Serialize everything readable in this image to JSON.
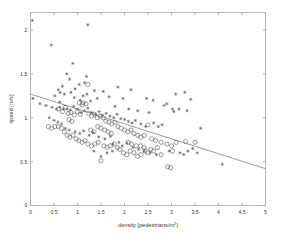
{
  "chart_data": {
    "type": "scatter",
    "title": "",
    "xlabel": "density [pedestrians/m²]",
    "xlabel_base": "density [pedestrians/m",
    "xlabel_sup": "2",
    "xlabel_tail": "]",
    "ylabel": "speed [m/s]",
    "xlim": [
      0,
      5
    ],
    "ylim": [
      0,
      2.2
    ],
    "grid": false,
    "legend": null,
    "xticks": [
      0,
      0.5,
      1,
      1.5,
      2,
      2.5,
      3,
      3.5,
      4,
      4.5,
      5
    ],
    "xtick_labels": [
      "0",
      "0.5",
      "1",
      "1.5",
      "2",
      "2.5",
      "3",
      "3.5",
      "4",
      "4.5",
      "5"
    ],
    "yticks": [
      0,
      0.5,
      1,
      1.5,
      2
    ],
    "ytick_labels": [
      "0",
      "0.5",
      "1",
      "1.5",
      "2"
    ],
    "marker_colors": {
      "circle": "#5c5c5c",
      "star": "#5c5c5c",
      "fit_line": "#6e6e6e",
      "axis": "#9a9a9a"
    },
    "fit_line": {
      "label": "linear fit",
      "x": [
        0,
        5
      ],
      "y": [
        1.27,
        0.42
      ],
      "slope": -0.17,
      "intercept": 1.27
    },
    "series": [
      {
        "name": "star-markers",
        "marker": "star",
        "points": [
          [
            0.04,
            2.11
          ],
          [
            0.44,
            1.83
          ],
          [
            1.22,
            2.06
          ],
          [
            0.9,
            1.62
          ],
          [
            0.77,
            1.5
          ],
          [
            0.83,
            1.44
          ],
          [
            1.19,
            1.47
          ],
          [
            1.04,
            1.38
          ],
          [
            0.68,
            1.36
          ],
          [
            0.59,
            1.32
          ],
          [
            0.63,
            1.29
          ],
          [
            1.36,
            1.31
          ],
          [
            1.2,
            1.27
          ],
          [
            0.05,
            1.22
          ],
          [
            0.52,
            1.25
          ],
          [
            0.72,
            1.27
          ],
          [
            0.86,
            1.29
          ],
          [
            0.93,
            1.23
          ],
          [
            1.06,
            1.2
          ],
          [
            1.12,
            1.25
          ],
          [
            1.28,
            1.19
          ],
          [
            1.42,
            1.22
          ],
          [
            1.55,
            1.3
          ],
          [
            1.67,
            1.24
          ],
          [
            1.86,
            1.35
          ],
          [
            2.14,
            1.32
          ],
          [
            2.47,
            1.22
          ],
          [
            2.61,
            1.2
          ],
          [
            3.09,
            1.27
          ],
          [
            3.28,
            1.29
          ],
          [
            3.41,
            1.21
          ],
          [
            3.16,
            1.1
          ],
          [
            2.84,
            1.14
          ],
          [
            2.9,
            1.16
          ],
          [
            3.02,
            1.1
          ],
          [
            3.33,
            1.08
          ],
          [
            0.2,
            1.16
          ],
          [
            0.33,
            1.14
          ],
          [
            0.46,
            1.12
          ],
          [
            0.55,
            1.1
          ],
          [
            0.62,
            1.12
          ],
          [
            0.7,
            1.1
          ],
          [
            0.78,
            1.1
          ],
          [
            0.85,
            1.09
          ],
          [
            0.92,
            1.13
          ],
          [
            1.0,
            1.1
          ],
          [
            1.08,
            1.06
          ],
          [
            1.15,
            1.08
          ],
          [
            1.22,
            1.11
          ],
          [
            1.3,
            1.06
          ],
          [
            1.38,
            1.04
          ],
          [
            1.46,
            1.07
          ],
          [
            1.53,
            1.03
          ],
          [
            1.61,
            1.05
          ],
          [
            1.69,
            1.02
          ],
          [
            1.77,
            1.0
          ],
          [
            1.84,
            1.04
          ],
          [
            1.92,
            0.99
          ],
          [
            2.0,
            0.98
          ],
          [
            2.08,
            0.96
          ],
          [
            2.16,
            0.94
          ],
          [
            2.23,
            0.97
          ],
          [
            2.35,
            0.93
          ],
          [
            2.45,
            0.9
          ],
          [
            0.4,
            1.0
          ],
          [
            0.5,
            0.97
          ],
          [
            0.58,
            0.95
          ],
          [
            0.66,
            0.93
          ],
          [
            0.74,
            0.88
          ],
          [
            0.82,
            0.86
          ],
          [
            0.95,
            0.84
          ],
          [
            1.05,
            0.82
          ],
          [
            1.13,
            0.85
          ],
          [
            1.25,
            0.8
          ],
          [
            1.33,
            0.83
          ],
          [
            1.45,
            0.78
          ],
          [
            1.58,
            0.76
          ],
          [
            1.7,
            0.79
          ],
          [
            1.75,
            0.7
          ],
          [
            1.88,
            0.72
          ],
          [
            1.95,
            0.68
          ],
          [
            2.05,
            0.71
          ],
          [
            2.18,
            0.66
          ],
          [
            2.3,
            0.64
          ],
          [
            2.42,
            0.62
          ],
          [
            2.55,
            0.6
          ],
          [
            2.68,
            0.58
          ],
          [
            2.95,
            0.62
          ],
          [
            3.18,
            0.6
          ],
          [
            3.26,
            0.58
          ],
          [
            3.35,
            0.62
          ],
          [
            3.45,
            0.65
          ],
          [
            3.62,
            0.88
          ],
          [
            3.55,
            0.6
          ],
          [
            4.08,
            0.47
          ],
          [
            2.8,
            0.92
          ],
          [
            2.62,
            0.94
          ],
          [
            2.72,
            0.9
          ],
          [
            1.5,
            0.56
          ],
          [
            1.63,
            0.6
          ],
          [
            1.74,
            0.62
          ],
          [
            3.05,
            1.07
          ],
          [
            2.52,
            1.06
          ],
          [
            2.28,
            1.08
          ],
          [
            1.97,
            1.22
          ],
          [
            2.09,
            1.1
          ],
          [
            1.8,
            1.13
          ],
          [
            1.35,
            0.62
          ],
          [
            0.95,
            1.33
          ],
          [
            1.15,
            1.4
          ],
          [
            0.62,
            1.18
          ]
        ]
      },
      {
        "name": "circle-markers",
        "marker": "circle",
        "points": [
          [
            0.38,
            0.9
          ],
          [
            0.45,
            0.88
          ],
          [
            0.52,
            0.9
          ],
          [
            0.6,
            1.1
          ],
          [
            0.68,
            1.07
          ],
          [
            0.74,
            1.12
          ],
          [
            0.8,
            1.05
          ],
          [
            0.86,
            1.06
          ],
          [
            0.93,
            1.03
          ],
          [
            1.0,
            1.07
          ],
          [
            1.06,
            1.04
          ],
          [
            1.1,
            1.15
          ],
          [
            1.18,
            1.16
          ],
          [
            1.24,
            1.05
          ],
          [
            1.3,
            1.02
          ],
          [
            1.36,
            1.04
          ],
          [
            1.42,
            1.0
          ],
          [
            1.48,
            1.02
          ],
          [
            1.55,
            1.0
          ],
          [
            1.6,
            0.96
          ],
          [
            1.67,
            0.95
          ],
          [
            1.73,
            0.93
          ],
          [
            1.8,
            0.95
          ],
          [
            1.86,
            0.9
          ],
          [
            1.93,
            0.88
          ],
          [
            2.0,
            0.86
          ],
          [
            2.07,
            0.84
          ],
          [
            2.14,
            0.86
          ],
          [
            2.2,
            0.82
          ],
          [
            2.28,
            0.8
          ],
          [
            2.35,
            0.78
          ],
          [
            2.42,
            0.8
          ],
          [
            2.5,
            0.92
          ],
          [
            2.58,
            0.76
          ],
          [
            2.66,
            0.74
          ],
          [
            2.78,
            0.72
          ],
          [
            2.9,
            0.7
          ],
          [
            3.0,
            0.68
          ],
          [
            3.1,
            0.72
          ],
          [
            3.3,
            0.73
          ],
          [
            3.5,
            0.72
          ],
          [
            0.72,
            0.84
          ],
          [
            0.78,
            0.8
          ],
          [
            0.84,
            0.78
          ],
          [
            0.9,
            0.8
          ],
          [
            0.97,
            0.76
          ],
          [
            1.03,
            0.74
          ],
          [
            1.1,
            0.72
          ],
          [
            1.16,
            0.74
          ],
          [
            1.22,
            0.7
          ],
          [
            1.3,
            0.68
          ],
          [
            1.37,
            0.7
          ],
          [
            1.44,
            0.72
          ],
          [
            1.5,
            0.51
          ],
          [
            1.56,
            0.68
          ],
          [
            1.63,
            0.66
          ],
          [
            1.7,
            0.68
          ],
          [
            1.78,
            0.7
          ],
          [
            1.85,
            0.66
          ],
          [
            1.9,
            0.64
          ],
          [
            1.98,
            0.6
          ],
          [
            2.05,
            0.58
          ],
          [
            2.12,
            0.62
          ],
          [
            2.2,
            0.6
          ],
          [
            2.28,
            0.56
          ],
          [
            2.35,
            0.58
          ],
          [
            2.44,
            0.62
          ],
          [
            2.5,
            0.6
          ],
          [
            2.56,
            0.64
          ],
          [
            2.62,
            0.62
          ],
          [
            2.7,
            0.66
          ],
          [
            2.78,
            0.58
          ],
          [
            2.92,
            0.44
          ],
          [
            2.98,
            0.43
          ],
          [
            1.22,
            1.38
          ],
          [
            1.04,
            1.17
          ],
          [
            1.12,
            1.17
          ],
          [
            0.66,
            0.88
          ],
          [
            0.59,
            0.9
          ],
          [
            1.43,
            0.9
          ],
          [
            1.5,
            0.88
          ],
          [
            1.58,
            0.86
          ],
          [
            1.65,
            0.84
          ],
          [
            1.72,
            0.82
          ],
          [
            2.42,
            0.66
          ],
          [
            2.34,
            0.68
          ],
          [
            3.02,
            0.62
          ],
          [
            1.28,
            0.86
          ],
          [
            1.35,
            0.84
          ],
          [
            0.88,
            0.96
          ],
          [
            0.82,
            0.98
          ],
          [
            2.08,
            0.72
          ],
          [
            2.15,
            0.7
          ],
          [
            2.25,
            0.68
          ]
        ]
      }
    ]
  }
}
